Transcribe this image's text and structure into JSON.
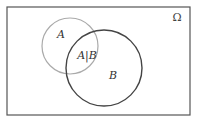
{
  "diagram": {
    "type": "venn",
    "universe": {
      "label": "Ω",
      "x": 7,
      "y": 7,
      "width": 183,
      "height": 108,
      "stroke": "#555555"
    },
    "sets": [
      {
        "name": "A",
        "label": "A",
        "cx": 70,
        "cy": 46,
        "r": 28,
        "stroke": "#aaaaaa",
        "label_x": 61,
        "label_y": 38
      },
      {
        "name": "B",
        "label": "B",
        "cx": 104,
        "cy": 68,
        "r": 38,
        "stroke": "#444444",
        "label_x": 113,
        "label_y": 79
      }
    ],
    "intersection": {
      "label": "A|B",
      "x": 87,
      "y": 59
    }
  }
}
